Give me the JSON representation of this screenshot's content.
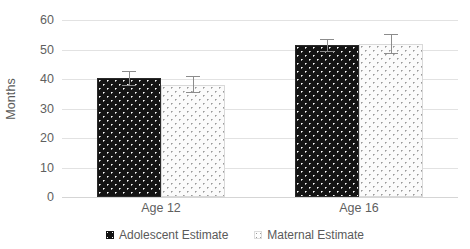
{
  "chart_data": {
    "type": "bar",
    "title": "",
    "xlabel": "",
    "ylabel": "Months",
    "categories": [
      "Age 12",
      "Age 16"
    ],
    "ylim": [
      0,
      60
    ],
    "yticks": [
      0,
      10,
      20,
      30,
      40,
      50,
      60
    ],
    "ytick_labels": [
      "0",
      "10",
      "20",
      "30",
      "40",
      "50",
      "60"
    ],
    "grid": true,
    "legend_position": "bottom",
    "series": [
      {
        "name": "Adolescent Estimate",
        "marker": "dark-dotted-square",
        "color": "#141414",
        "values": [
          40.2,
          51.5
        ],
        "errors": [
          2.6,
          2.2
        ]
      },
      {
        "name": "Maternal Estimate",
        "marker": "light-dotted-square",
        "color": "#fbfbfb",
        "values": [
          38.0,
          51.8
        ],
        "errors": [
          2.9,
          3.4
        ]
      }
    ]
  },
  "axis": {
    "y_title": "Months",
    "y_labels": [
      "60",
      "50",
      "40",
      "30",
      "20",
      "10",
      "0"
    ],
    "x_labels": [
      "Age 12",
      "Age 16"
    ]
  },
  "legend": {
    "items": [
      {
        "label": "Adolescent Estimate",
        "swatch": "dark-dotted-square"
      },
      {
        "label": "Maternal Estimate",
        "swatch": "light-dotted-square"
      }
    ]
  }
}
